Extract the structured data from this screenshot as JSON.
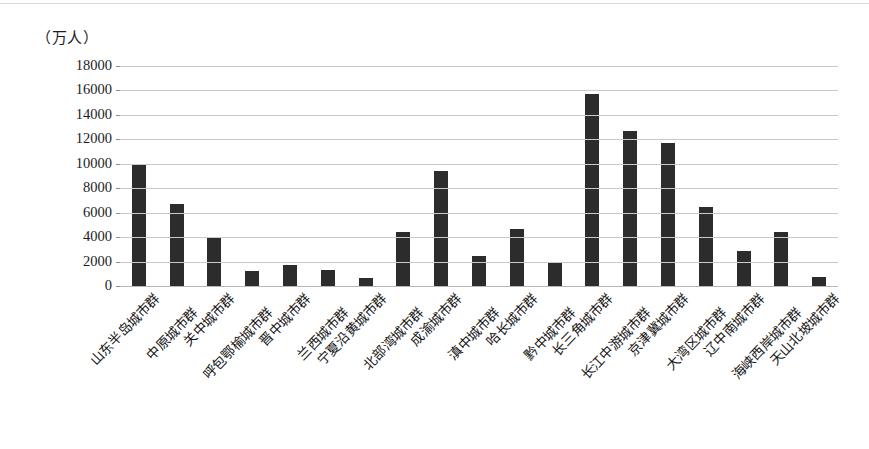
{
  "chart_data": {
    "type": "bar",
    "title": "",
    "unit_label": "（万人）",
    "xlabel": "",
    "ylabel": "",
    "ylim": [
      0,
      18000
    ],
    "ytick_step": 2000,
    "yticks": [
      "18000",
      "16000",
      "14000",
      "12000",
      "10000",
      "8000",
      "6000",
      "4000",
      "2000",
      "0"
    ],
    "grid": true,
    "legend": "none",
    "bar_color": "#2c2c2c",
    "gridline_color": "#c9c9c9",
    "categories": [
      "山东半岛城市群",
      "中原城市群",
      "关中城市群",
      "呼包鄂榆城市群",
      "晋中城市群",
      "兰西城市群",
      "宁夏沿黄城市群",
      "北部湾城市群",
      "成渝城市群",
      "滇中城市群",
      "哈长城市群",
      "黔中城市群",
      "长三角城市群",
      "长江中游城市群",
      "京津冀城市群",
      "大湾区城市群",
      "辽中南城市群",
      "海峡西岸城市群",
      "天山北坡城市群"
    ],
    "values": [
      9950,
      6700,
      4050,
      1200,
      1700,
      1350,
      650,
      4450,
      9450,
      2450,
      4700,
      1950,
      15750,
      12650,
      11700,
      6500,
      2850,
      4400,
      700
    ]
  }
}
